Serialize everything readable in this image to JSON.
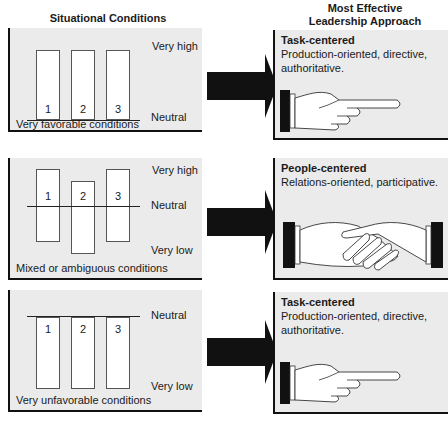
{
  "headers": {
    "left": "Situational Conditions",
    "right_line1": "Most Effective",
    "right_line2": "Leadership Approach"
  },
  "rows": [
    {
      "condition": "Very favorable conditions",
      "scale_top": "Very high",
      "scale_bottom": "Neutral",
      "bars": [
        "1",
        "2",
        "3"
      ],
      "approach_title": "Task-centered",
      "approach_desc": "Production-oriented, directive, authoritative.",
      "icon": "pointing-hand-icon"
    },
    {
      "condition": "Mixed or ambiguous conditions",
      "scale_top": "Very high",
      "scale_mid": "Neutral",
      "scale_bottom": "Very low",
      "bars": [
        "1",
        "2",
        "3"
      ],
      "approach_title": "People-centered",
      "approach_desc": "Relations-oriented, participative.",
      "icon": "handshake-icon"
    },
    {
      "condition": "Very unfavorable conditions",
      "scale_top": "Neutral",
      "scale_bottom": "Very low",
      "bars": [
        "1",
        "2",
        "3"
      ],
      "approach_title": "Task-centered",
      "approach_desc": "Production-oriented, directive, authoritative.",
      "icon": "pointing-hand-icon"
    }
  ],
  "colors": {
    "panel_bg": "#ebebeb",
    "border": "#111111",
    "arrow": "#111111",
    "bar_fill": "#ffffff"
  }
}
